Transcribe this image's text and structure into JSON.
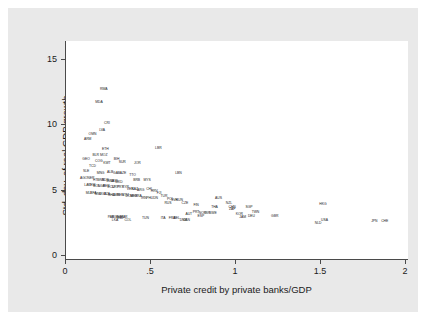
{
  "chart_data": {
    "type": "scatter",
    "title": "",
    "subtitle": "",
    "xlabel": "Private credit by private banks/GDP",
    "ylabel": "Std. dev. of real GDP growth",
    "xlim": [
      -0.05,
      2.08
    ],
    "ylim": [
      -0.6,
      16.4
    ],
    "xticks": [
      "0",
      ".5",
      "1",
      "1.5",
      "2"
    ],
    "xtick_values": [
      0,
      0.5,
      1,
      1.5,
      2
    ],
    "yticks": [
      "0",
      "5",
      "10",
      "15"
    ],
    "ytick_values": [
      0,
      5,
      10,
      15
    ],
    "grid": false,
    "legend": "none",
    "marker_style": "text-label",
    "note": "Each observation is plotted as its ISO-3 country code rather than a point marker.",
    "points": [
      {
        "label": "RWA",
        "x": 0.185,
        "y": 12.6
      },
      {
        "label": "MDA",
        "x": 0.155,
        "y": 11.6
      },
      {
        "label": "CRI",
        "x": 0.205,
        "y": 9.9
      },
      {
        "label": "LVA",
        "x": 0.175,
        "y": 9.4
      },
      {
        "label": "OMN",
        "x": 0.115,
        "y": 9.1
      },
      {
        "label": "ARM",
        "x": 0.085,
        "y": 8.7
      },
      {
        "label": "LBR",
        "x": 0.525,
        "y": 8.0
      },
      {
        "label": "ETH",
        "x": 0.195,
        "y": 7.9
      },
      {
        "label": "BLR",
        "x": 0.135,
        "y": 7.4
      },
      {
        "label": "MOZ",
        "x": 0.185,
        "y": 7.4
      },
      {
        "label": "GEO",
        "x": 0.075,
        "y": 7.1
      },
      {
        "label": "COG",
        "x": 0.155,
        "y": 7.0
      },
      {
        "label": "BIH",
        "x": 0.265,
        "y": 7.1
      },
      {
        "label": "KWT",
        "x": 0.205,
        "y": 6.8
      },
      {
        "label": "SUR",
        "x": 0.3,
        "y": 6.9
      },
      {
        "label": "TCD",
        "x": 0.115,
        "y": 6.6
      },
      {
        "label": "JOR",
        "x": 0.395,
        "y": 6.8
      },
      {
        "label": "SLE",
        "x": 0.075,
        "y": 6.2
      },
      {
        "label": "MNG",
        "x": 0.165,
        "y": 6.0
      },
      {
        "label": "ALB",
        "x": 0.225,
        "y": 6.1
      },
      {
        "label": "GAB",
        "x": 0.265,
        "y": 6.0
      },
      {
        "label": "AZE",
        "x": 0.305,
        "y": 6.0
      },
      {
        "label": "LBN",
        "x": 0.65,
        "y": 6.0
      },
      {
        "label": "TTO",
        "x": 0.365,
        "y": 5.9
      },
      {
        "label": "AGO",
        "x": 0.06,
        "y": 5.6
      },
      {
        "label": "NER",
        "x": 0.105,
        "y": 5.6
      },
      {
        "label": "HTI",
        "x": 0.135,
        "y": 5.5
      },
      {
        "label": "GNB",
        "x": 0.165,
        "y": 5.5
      },
      {
        "label": "SDN",
        "x": 0.195,
        "y": 5.5
      },
      {
        "label": "BWA",
        "x": 0.225,
        "y": 5.4
      },
      {
        "label": "UKR",
        "x": 0.25,
        "y": 5.4
      },
      {
        "label": "MKD",
        "x": 0.28,
        "y": 5.3
      },
      {
        "label": "BRB",
        "x": 0.39,
        "y": 5.5
      },
      {
        "label": "MYS",
        "x": 0.455,
        "y": 5.5
      },
      {
        "label": "LAO",
        "x": 0.085,
        "y": 5.1
      },
      {
        "label": "YEM",
        "x": 0.11,
        "y": 5.1
      },
      {
        "label": "BOL",
        "x": 0.14,
        "y": 5.0
      },
      {
        "label": "NGA",
        "x": 0.17,
        "y": 5.0
      },
      {
        "label": "PER",
        "x": 0.2,
        "y": 5.0
      },
      {
        "label": "ECU",
        "x": 0.23,
        "y": 4.9
      },
      {
        "label": "URY",
        "x": 0.258,
        "y": 4.9
      },
      {
        "label": "PRY",
        "x": 0.288,
        "y": 4.9
      },
      {
        "label": "SYR",
        "x": 0.32,
        "y": 4.9
      },
      {
        "label": "VEN",
        "x": 0.35,
        "y": 4.8
      },
      {
        "label": "KAZ",
        "x": 0.378,
        "y": 4.8
      },
      {
        "label": "CHL",
        "x": 0.47,
        "y": 4.8
      },
      {
        "label": "ARG",
        "x": 0.415,
        "y": 4.7
      },
      {
        "label": "HRV",
        "x": 0.5,
        "y": 4.6
      },
      {
        "label": "FJI",
        "x": 0.53,
        "y": 4.5
      },
      {
        "label": "MLI",
        "x": 0.09,
        "y": 4.5
      },
      {
        "label": "BFA",
        "x": 0.12,
        "y": 4.5
      },
      {
        "label": "MWI",
        "x": 0.15,
        "y": 4.4
      },
      {
        "label": "UGA",
        "x": 0.178,
        "y": 4.4
      },
      {
        "label": "TZA",
        "x": 0.205,
        "y": 4.4
      },
      {
        "label": "GHA",
        "x": 0.232,
        "y": 4.3
      },
      {
        "label": "CMR",
        "x": 0.26,
        "y": 4.3
      },
      {
        "label": "SEN",
        "x": 0.288,
        "y": 4.3
      },
      {
        "label": "GTM",
        "x": 0.318,
        "y": 4.3
      },
      {
        "label": "DOM",
        "x": 0.345,
        "y": 4.2
      },
      {
        "label": "MEX",
        "x": 0.373,
        "y": 4.2
      },
      {
        "label": "BRA",
        "x": 0.4,
        "y": 4.2
      },
      {
        "label": "IRN",
        "x": 0.435,
        "y": 4.1
      },
      {
        "label": "PHL",
        "x": 0.47,
        "y": 4.1
      },
      {
        "label": "IDN",
        "x": 0.505,
        "y": 4.1
      },
      {
        "label": "TUR",
        "x": 0.56,
        "y": 4.2
      },
      {
        "label": "POL",
        "x": 0.6,
        "y": 4.0
      },
      {
        "label": "SVK",
        "x": 0.625,
        "y": 3.9
      },
      {
        "label": "HUN",
        "x": 0.655,
        "y": 3.9
      },
      {
        "label": "RUS",
        "x": 0.585,
        "y": 3.7
      },
      {
        "label": "CZE",
        "x": 0.69,
        "y": 3.7
      },
      {
        "label": "AUS",
        "x": 0.9,
        "y": 4.1
      },
      {
        "label": "NZL",
        "x": 0.965,
        "y": 3.7
      },
      {
        "label": "FIN",
        "x": 0.76,
        "y": 3.5
      },
      {
        "label": "THA",
        "x": 0.875,
        "y": 3.4
      },
      {
        "label": "CHN",
        "x": 0.985,
        "y": 3.4
      },
      {
        "label": "SGP",
        "x": 1.09,
        "y": 3.4
      },
      {
        "label": "ZAF",
        "x": 0.985,
        "y": 3.2
      },
      {
        "label": "TWN",
        "x": 1.13,
        "y": 3.0
      },
      {
        "label": "PRT",
        "x": 0.76,
        "y": 3.0
      },
      {
        "label": "NOR",
        "x": 0.8,
        "y": 2.9
      },
      {
        "label": "ISR",
        "x": 0.83,
        "y": 2.9
      },
      {
        "label": "SWE",
        "x": 0.865,
        "y": 2.9
      },
      {
        "label": "KOR",
        "x": 1.03,
        "y": 2.8
      },
      {
        "label": "DEU",
        "x": 1.105,
        "y": 2.7
      },
      {
        "label": "AUT",
        "x": 0.715,
        "y": 2.8
      },
      {
        "label": "ESP",
        "x": 0.79,
        "y": 2.7
      },
      {
        "label": "JAM",
        "x": 1.05,
        "y": 2.6
      },
      {
        "label": "GBR",
        "x": 1.25,
        "y": 2.7
      },
      {
        "label": "HKG",
        "x": 1.55,
        "y": 3.6
      },
      {
        "label": "USA",
        "x": 1.56,
        "y": 2.4
      },
      {
        "label": "NLD",
        "x": 1.52,
        "y": 2.1
      },
      {
        "label": "IND",
        "x": 0.29,
        "y": 2.5
      },
      {
        "label": "COL",
        "x": 0.335,
        "y": 2.4
      },
      {
        "label": "LKA",
        "x": 0.255,
        "y": 2.4
      },
      {
        "label": "PAK",
        "x": 0.23,
        "y": 2.6
      },
      {
        "label": "BGD",
        "x": 0.258,
        "y": 2.6
      },
      {
        "label": "EGY",
        "x": 0.285,
        "y": 2.6
      },
      {
        "label": "MAR",
        "x": 0.31,
        "y": 2.6
      },
      {
        "label": "TUN",
        "x": 0.445,
        "y": 2.5
      },
      {
        "label": "ITA",
        "x": 0.555,
        "y": 2.5
      },
      {
        "label": "FRA",
        "x": 0.61,
        "y": 2.5
      },
      {
        "label": "BEL",
        "x": 0.64,
        "y": 2.5
      },
      {
        "label": "DNK",
        "x": 0.68,
        "y": 2.4
      },
      {
        "label": "CAN",
        "x": 0.7,
        "y": 2.4
      },
      {
        "label": "JPN",
        "x": 1.87,
        "y": 2.3
      },
      {
        "label": "CHE",
        "x": 1.935,
        "y": 2.3
      }
    ]
  },
  "axes": {
    "ylabel": "Std. dev. of real GDP growth",
    "xlabel": "Private credit by private banks/GDP",
    "yticks": [
      {
        "label": "15",
        "value": 15
      },
      {
        "label": "10",
        "value": 10
      },
      {
        "label": "5",
        "value": 5
      },
      {
        "label": "0",
        "value": 0
      }
    ],
    "xticks": [
      {
        "label": "0",
        "value": 0
      },
      {
        "label": ".5",
        "value": 0.5
      },
      {
        "label": "1",
        "value": 1
      },
      {
        "label": "1.5",
        "value": 1.5
      },
      {
        "label": "2",
        "value": 2
      }
    ]
  },
  "colors": {
    "figure_background": "#e9e9e9",
    "plot_background": "#ffffff",
    "axis_line": "#4a4a4a",
    "text": "#1b1b1b",
    "page_background": "#ffffff"
  }
}
